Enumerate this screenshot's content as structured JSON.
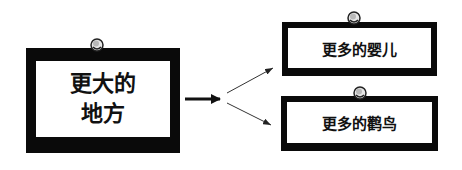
{
  "diagram": {
    "source": {
      "line1": "更大的",
      "line2": "地方"
    },
    "targets": [
      {
        "label": "更多的婴儿"
      },
      {
        "label": "更多的鹳鸟"
      }
    ],
    "colors": {
      "border": "#0a0a0a",
      "background": "#ffffff",
      "pin": "#d8d8d8"
    }
  }
}
